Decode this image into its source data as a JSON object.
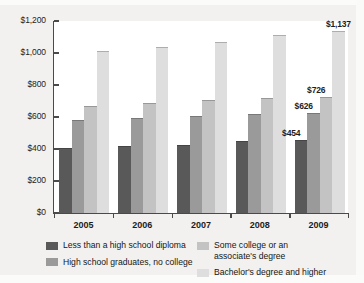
{
  "chart_data": {
    "type": "bar",
    "title": "",
    "subtitle": "",
    "xlabel": "",
    "ylabel": "",
    "categories": [
      "2005",
      "2006",
      "2007",
      "2008",
      "2009"
    ],
    "ylim": [
      0,
      1200
    ],
    "yticks": [
      0,
      200,
      400,
      600,
      800,
      1000,
      1200
    ],
    "ytick_labels": [
      "$0",
      "$200",
      "$400",
      "$600",
      "$800",
      "$1,000",
      "$1,200"
    ],
    "grid": false,
    "legend_position": "bottom",
    "series": [
      {
        "name": "Less than a high school diploma",
        "color": "#595959",
        "values": [
          409,
          419,
          428,
          452,
          454
        ]
      },
      {
        "name": "High school graduates, no college",
        "color": "#9a9a9a",
        "values": [
          583,
          595,
          604,
          618,
          626
        ]
      },
      {
        "name": "Some college or an\nassociate's degree",
        "color": "#c3c3c3",
        "values": [
          670,
          690,
          706,
          721,
          726
        ]
      },
      {
        "name": "Bachelor's degree and higher",
        "color": "#dedede",
        "values": [
          1010,
          1039,
          1069,
          1115,
          1137
        ]
      }
    ],
    "data_labels": [
      {
        "group": "2009",
        "series": "Less than a high school diploma",
        "text": "$454"
      },
      {
        "group": "2009",
        "series": "High school graduates, no college",
        "text": "$626"
      },
      {
        "group": "2009",
        "series": "Some college or an associate's degree",
        "text": "$726"
      },
      {
        "group": "2009",
        "series": "Bachelor's degree and higher",
        "text": "$1,137"
      }
    ]
  },
  "legend": {
    "left": [
      {
        "label": "Less than a high school diploma",
        "color": "#595959"
      },
      {
        "label": "High school graduates, no college",
        "color": "#9a9a9a"
      }
    ],
    "right": [
      {
        "label": "Some college or an\nassociate's degree",
        "color": "#c3c3c3"
      },
      {
        "label": "Bachelor's degree and higher",
        "color": "#dedede"
      }
    ]
  }
}
